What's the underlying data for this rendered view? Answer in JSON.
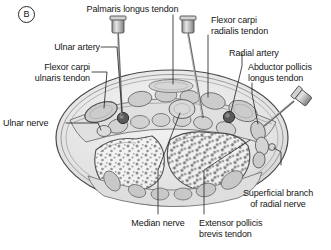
{
  "figure": {
    "panel_label": "B",
    "colors": {
      "ink": "#151515",
      "leader": "#2a2a2a",
      "skin_outline": "#4a4a4a",
      "fill_light": "#e8e8e8",
      "fill_mid": "#cfcfcf",
      "fill_dark": "#9a9a9a",
      "bone_fill": "#f2f2f2",
      "vessel_dark": "#5a5a5a",
      "needle_metal": "#b9b9b9"
    }
  },
  "labels": [
    {
      "id": "palmaris-longus-tendon",
      "text": "Palmaris longus tendon"
    },
    {
      "id": "flexor-carpi-radialis-tendon",
      "text": "Flexor carpi\nradialis tendon"
    },
    {
      "id": "ulnar-artery",
      "text": "Ulnar artery"
    },
    {
      "id": "radial-artery",
      "text": "Radial artery"
    },
    {
      "id": "flexor-carpi-ulnaris-tendon",
      "text": "Flexor carpi\nulnaris tendon"
    },
    {
      "id": "abductor-pollicis-longus-tendon",
      "text": "Abductor pollicis\nlongus tendon"
    },
    {
      "id": "ulnar-nerve",
      "text": "Ulnar nerve"
    },
    {
      "id": "superficial-branch-radial-nerve",
      "text": "Superficial branch\nof radial nerve"
    },
    {
      "id": "median-nerve",
      "text": "Median nerve"
    },
    {
      "id": "extensor-pollicis-brevis-tendon",
      "text": "Extensor pollicis\nbrevis tendon"
    }
  ],
  "needles": [
    {
      "id": "needle-ulnar",
      "orientation": "vertical"
    },
    {
      "id": "needle-radial",
      "orientation": "vertical"
    },
    {
      "id": "needle-dorsal",
      "orientation": "oblique"
    }
  ]
}
